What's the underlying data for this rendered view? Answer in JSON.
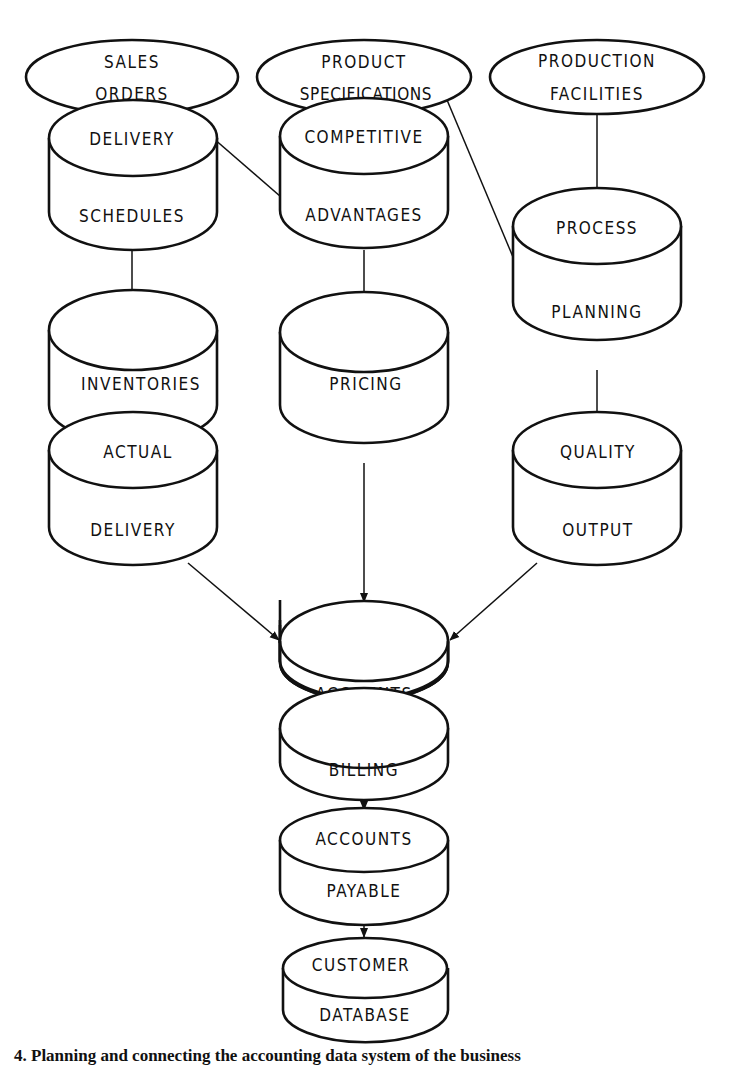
{
  "diagram": {
    "sources": [
      {
        "id": "sales_orders",
        "line1": "SALES",
        "line2": "ORDERS"
      },
      {
        "id": "product_specs",
        "line1": "PRODUCT",
        "line2": "SPECIFICATIONS"
      },
      {
        "id": "production_facilities",
        "line1": "PRODUCTION",
        "line2": "FACILITIES"
      }
    ],
    "stores": [
      {
        "id": "delivery_schedules",
        "line1": "DELIVERY",
        "line2": "SCHEDULES"
      },
      {
        "id": "competitive_advantages",
        "line1": "COMPETITIVE",
        "line2": "ADVANTAGES"
      },
      {
        "id": "process_planning",
        "line1": "PROCESS",
        "line2": "PLANNING"
      },
      {
        "id": "inventories",
        "line1": "",
        "line2": "INVENTORIES"
      },
      {
        "id": "pricing",
        "line1": "",
        "line2": "PRICING"
      },
      {
        "id": "actual_delivery",
        "line1": "ACTUAL",
        "line2": "DELIVERY"
      },
      {
        "id": "quality_output",
        "line1": "QUALITY",
        "line2": "OUTPUT"
      },
      {
        "id": "accounts",
        "line1": "",
        "line2": "ACCOUNTS"
      },
      {
        "id": "billing",
        "line1": "",
        "line2": "BILLING"
      },
      {
        "id": "accounts_payable",
        "line1": "ACCOUNTS",
        "line2": "PAYABLE"
      },
      {
        "id": "customer_database",
        "line1": "CUSTOMER",
        "line2": "DATABASE"
      }
    ],
    "edges": [
      [
        "sales_orders",
        "delivery_schedules"
      ],
      [
        "competitive_advantages",
        "sales_orders"
      ],
      [
        "product_specs",
        "competitive_advantages"
      ],
      [
        "product_specs",
        "process_planning"
      ],
      [
        "production_facilities",
        "process_planning"
      ],
      [
        "delivery_schedules",
        "inventories"
      ],
      [
        "competitive_advantages",
        "pricing"
      ],
      [
        "inventories",
        "actual_delivery"
      ],
      [
        "process_planning",
        "quality_output"
      ],
      [
        "actual_delivery",
        "accounts"
      ],
      [
        "pricing",
        "accounts"
      ],
      [
        "quality_output",
        "accounts"
      ],
      [
        "accounts",
        "billing"
      ],
      [
        "billing",
        "accounts_payable"
      ],
      [
        "accounts_payable",
        "customer_database"
      ]
    ],
    "caption": "4.  Planning and connecting the accounting data system of the business"
  }
}
